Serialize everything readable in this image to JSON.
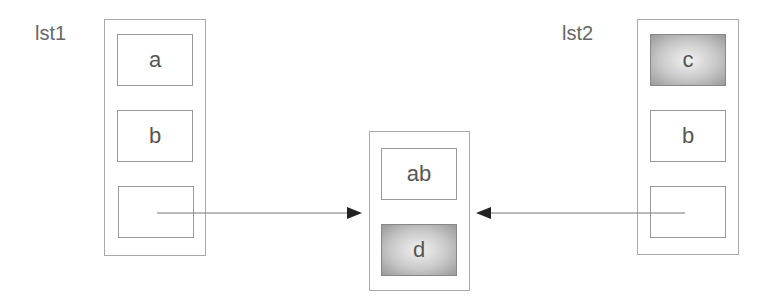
{
  "diagram": {
    "lists": [
      {
        "label": "lst1",
        "cells": [
          {
            "text": "a",
            "shaded": false
          },
          {
            "text": "b",
            "shaded": false
          },
          {
            "text": "",
            "shaded": false
          }
        ]
      },
      {
        "label": "lst2",
        "cells": [
          {
            "text": "c",
            "shaded": true
          },
          {
            "text": "b",
            "shaded": false
          },
          {
            "text": "",
            "shaded": false
          }
        ]
      }
    ],
    "result": {
      "cells": [
        {
          "text": "ab",
          "shaded": false
        },
        {
          "text": "d",
          "shaded": true
        }
      ]
    },
    "arrows": [
      {
        "from": "lst1.cells.2",
        "to": "result"
      },
      {
        "from": "lst2.cells.2",
        "to": "result"
      }
    ],
    "colors": {
      "line": "#777777",
      "border": "#999999",
      "shade_dark": "#9a9a9a",
      "shade_light": "#f2f2f2"
    }
  }
}
